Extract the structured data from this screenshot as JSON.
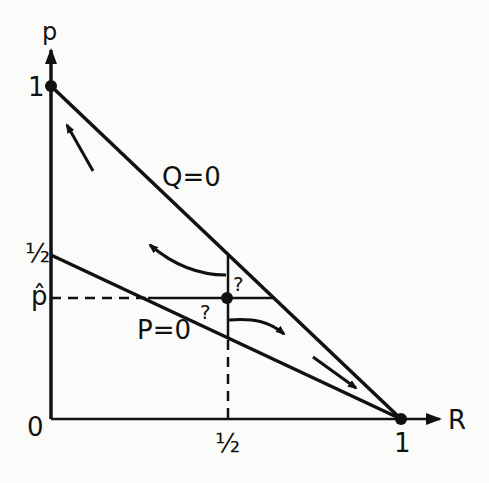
{
  "diagram": {
    "axes": {
      "y_label": "p",
      "x_label": "R",
      "origin_label": "0",
      "y_tick_one": "1",
      "y_tick_half": "½",
      "y_tick_phat": "p̂",
      "x_tick_half": "½",
      "x_tick_one": "1"
    },
    "curves": {
      "q_zero": "Q=0",
      "p_zero": "P=0"
    },
    "question_marks": [
      "?",
      "?"
    ],
    "colors": {
      "ink": "#111111",
      "background": "#fbfbfa"
    }
  }
}
